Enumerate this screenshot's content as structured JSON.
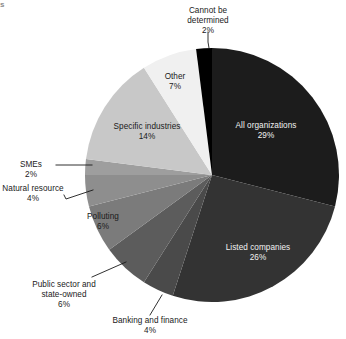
{
  "artifact": {
    "top_left_fragment": "s"
  },
  "chart_data": {
    "type": "pie",
    "title": "",
    "subtitle": "",
    "xlabel": "",
    "ylabel": "",
    "legend_position": "none",
    "grid": false,
    "start_angle_deg": 0,
    "direction": "clockwise",
    "units": "percent",
    "total": 100,
    "categories": [
      "All organizations",
      "Listed companies",
      "Banking and finance",
      "Public sector and state-owned",
      "Polluting",
      "Natural resource",
      "SMEs",
      "Specific industries",
      "Other",
      "Cannot be determined"
    ],
    "values": [
      29,
      26,
      4,
      6,
      6,
      4,
      2,
      14,
      7,
      2
    ],
    "value_labels": [
      "29%",
      "26%",
      "4%",
      "6%",
      "6%",
      "4%",
      "2%",
      "14%",
      "7%",
      "2%"
    ],
    "colors": [
      "#1c1c1c",
      "#333333",
      "#4a4a4a",
      "#5c5c5c",
      "#7b7b7b",
      "#8e8e8e",
      "#9e9e9e",
      "#c8c8c8",
      "#f0f0f0",
      "#000000"
    ],
    "slices": [
      {
        "label": "All organizations",
        "value": 29,
        "value_label": "29%",
        "color": "#1c1c1c",
        "label_placement": "inside",
        "label_color": "#f2f2f2"
      },
      {
        "label": "Listed companies",
        "value": 26,
        "value_label": "26%",
        "color": "#333333",
        "label_placement": "inside",
        "label_color": "#f2f2f2"
      },
      {
        "label": "Banking and finance",
        "value": 4,
        "value_label": "4%",
        "color": "#4a4a4a",
        "label_placement": "outside-leader",
        "label_color": "#1a1a1a"
      },
      {
        "label": "Public sector and state-owned",
        "value": 6,
        "value_label": "6%",
        "color": "#5c5c5c",
        "label_placement": "outside-leader",
        "label_color": "#1a1a1a"
      },
      {
        "label": "Polluting",
        "value": 6,
        "value_label": "6%",
        "color": "#7b7b7b",
        "label_placement": "inside",
        "label_color": "#1a1a1a"
      },
      {
        "label": "Natural resource",
        "value": 4,
        "value_label": "4%",
        "color": "#8e8e8e",
        "label_placement": "outside-leader",
        "label_color": "#1a1a1a"
      },
      {
        "label": "SMEs",
        "value": 2,
        "value_label": "2%",
        "color": "#9e9e9e",
        "label_placement": "outside-leader",
        "label_color": "#1a1a1a"
      },
      {
        "label": "Specific industries",
        "value": 14,
        "value_label": "14%",
        "color": "#c8c8c8",
        "label_placement": "inside",
        "label_color": "#1a1a1a"
      },
      {
        "label": "Other",
        "value": 7,
        "value_label": "7%",
        "color": "#f0f0f0",
        "label_placement": "inside",
        "label_color": "#1a1a1a"
      },
      {
        "label": "Cannot be determined",
        "value": 2,
        "value_label": "2%",
        "color": "#000000",
        "label_placement": "outside-leader",
        "label_color": "#1a1a1a"
      }
    ]
  },
  "labels": {
    "cannot_be_determined": {
      "line1": "Cannot be",
      "line2": "determined",
      "pct": "2%"
    },
    "other": {
      "line1": "Other",
      "pct": "7%"
    },
    "all_organizations": {
      "line1": "All organizations",
      "pct": "29%"
    },
    "specific_industries": {
      "line1": "Specific industries",
      "pct": "14%"
    },
    "smes": {
      "line1": "SMEs",
      "pct": "2%"
    },
    "natural_resource": {
      "line1": "Natural resource",
      "pct": "4%"
    },
    "polluting": {
      "line1": "Polluting",
      "pct": "6%"
    },
    "listed_companies": {
      "line1": "Listed companies",
      "pct": "26%"
    },
    "public_sector": {
      "line1": "Public sector and",
      "line2": "state-owned",
      "pct": "6%"
    },
    "banking_and_finance": {
      "line1": "Banking and finance",
      "pct": "4%"
    }
  }
}
